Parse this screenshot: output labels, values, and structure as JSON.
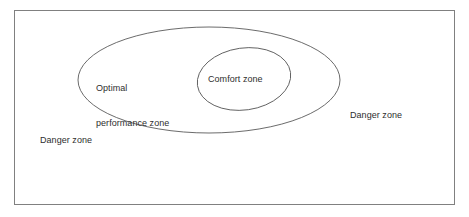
{
  "diagram": {
    "frame": {
      "name": "outer-frame",
      "x": 14,
      "y": 10,
      "width": 441,
      "height": 195,
      "stroke": "#808080",
      "fill": "#ffffff"
    },
    "shapes": [
      {
        "name": "optimal-performance-ellipse",
        "type": "ellipse",
        "cx": 209,
        "cy": 80,
        "rx": 131,
        "ry": 53,
        "rotation": 0,
        "stroke": "#5a5a5a",
        "fill": "none"
      },
      {
        "name": "comfort-zone-ellipse",
        "type": "ellipse",
        "cx": 244,
        "cy": 79,
        "rx": 47,
        "ry": 31,
        "rotation": -8,
        "stroke": "#5a5a5a",
        "fill": "none"
      }
    ],
    "labels": {
      "optimal_performance_line1": "Optimal",
      "optimal_performance_line2": "performance zone",
      "comfort": "Comfort zone",
      "danger_left": "Danger zone",
      "danger_right": "Danger zone"
    },
    "colors": {
      "background": "#ffffff",
      "frame_stroke": "#808080",
      "ellipse_stroke": "#5a5a5a",
      "text": "#2e2e2e"
    }
  }
}
